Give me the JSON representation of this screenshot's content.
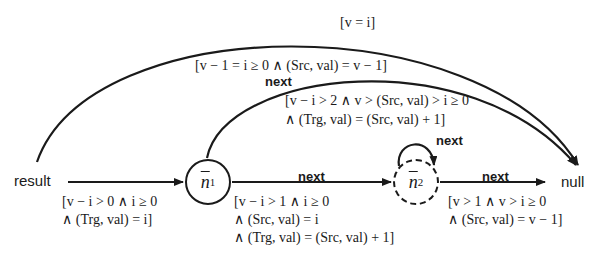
{
  "diagram": {
    "nodes": {
      "result": {
        "label": "result"
      },
      "n1": {
        "label": "n",
        "subscript": "1",
        "style": "solid"
      },
      "n2": {
        "label": "n",
        "subscript": "2",
        "style": "dashed"
      },
      "null": {
        "label": "null"
      }
    },
    "edges": {
      "result_n1": {
        "label_line1": "[v − i > 0 ∧ i ≥ 0",
        "label_line2": "∧ (Trg, val) = i]"
      },
      "n1_n2": {
        "name": "next",
        "label_line1": "[v − i > 1 ∧ i ≥ 0",
        "label_line2": "∧ (Src, val) = i",
        "label_line3": "∧ (Trg, val) = (Src, val) + 1]"
      },
      "n2_self": {
        "name": "next",
        "label_line1": "[v − i > 2 ∧ v > (Src, val) > i ≥ 0",
        "label_line2": "∧ (Trg, val) = (Src, val) + 1]"
      },
      "n2_null": {
        "name": "next",
        "label_line1": "[v > 1 ∧ v > i ≥ 0",
        "label_line2": "∧ (Src, val) = v − 1]"
      },
      "n1_null": {
        "name": "next",
        "label": "[v − 1 = i ≥ 0 ∧ (Src, val) = v − 1]"
      },
      "result_null": {
        "label": "[v = i]"
      }
    },
    "colors": {
      "stroke": "#1a1a1a",
      "background": "#ffffff"
    }
  }
}
